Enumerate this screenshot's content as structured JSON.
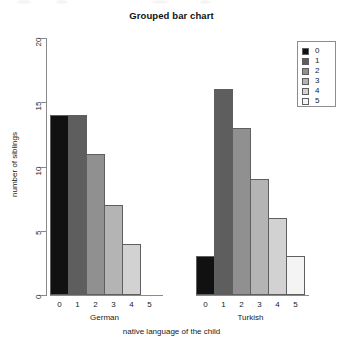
{
  "chart_data": {
    "type": "bar",
    "title": "Grouped bar chart",
    "xlabel": "native language of the child",
    "ylabel": "number of siblings",
    "categories": [
      "0",
      "1",
      "2",
      "3",
      "4",
      "5"
    ],
    "groups": [
      "German",
      "Turkish"
    ],
    "series": [
      {
        "name": "German",
        "values": [
          14,
          14,
          11,
          7,
          4,
          0
        ]
      },
      {
        "name": "Turkish",
        "values": [
          3,
          16,
          13,
          9,
          6,
          3
        ]
      }
    ],
    "ylim": [
      0,
      20
    ],
    "yticks": [
      "0",
      "5",
      "10",
      "15",
      "20"
    ],
    "ytick_values": [
      0,
      5,
      10,
      15,
      20
    ],
    "grid": false,
    "legend_position": "top-right",
    "legend_title": "",
    "legend_entries": [
      {
        "label": "0",
        "color": "#111111"
      },
      {
        "label": "1",
        "color": "#5e5e5e"
      },
      {
        "label": "2",
        "color": "#909090"
      },
      {
        "label": "3",
        "color": "#b4b4b4"
      },
      {
        "label": "4",
        "color": "#d2d2d2"
      },
      {
        "label": "5",
        "color": "#f4f4f4"
      }
    ]
  }
}
